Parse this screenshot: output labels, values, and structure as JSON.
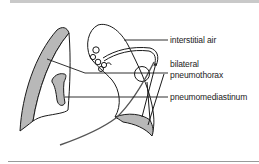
{
  "figure": {
    "type": "medical-line-illustration",
    "labels": {
      "interstitial_air": "interstitial air",
      "bilateral": "bilateral",
      "pneumothorax": "pneumothorax",
      "pneumomediastinum": "pneumomediastinum"
    },
    "colors": {
      "line": "#1a1a1a",
      "shading": "#b8b8b8",
      "top_bar": "#c9c9c9",
      "rule": "#9a9a9a"
    }
  }
}
